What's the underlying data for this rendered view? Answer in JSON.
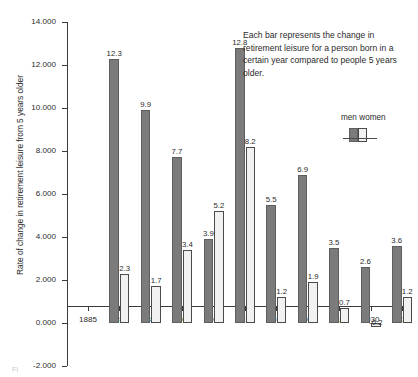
{
  "chart_data": {
    "type": "bar",
    "title": "",
    "xlabel": "",
    "ylabel": "Rate of change in retirement leisure from 5 years older",
    "categories": [
      "1885",
      "1890",
      "1895",
      "1900",
      "1905",
      "1910",
      "1915",
      "1920",
      "1925",
      "1930",
      "1935"
    ],
    "series": [
      {
        "name": "men",
        "color": "#7b7b7b",
        "values": [
          null,
          12.3,
          9.9,
          7.7,
          3.9,
          12.8,
          5.5,
          6.9,
          3.5,
          2.6,
          3.6
        ],
        "labels": [
          "",
          "12.3",
          "9.9",
          "7.7",
          "3.9",
          "12.8",
          "5.5",
          "6.9",
          "3.5",
          "2.6",
          "3.6"
        ]
      },
      {
        "name": "women",
        "color": "#f1f1f1",
        "values": [
          null,
          2.3,
          1.7,
          3.4,
          5.2,
          8.2,
          1.2,
          1.9,
          0.7,
          -0.2,
          1.2
        ],
        "labels": [
          "",
          "2.3",
          "1.7",
          "3.4",
          "5.2",
          "8.2",
          "1.2",
          "1.9",
          "0.7",
          "-0.2",
          "1.2"
        ]
      }
    ],
    "ylim": [
      -2.0,
      14.0
    ],
    "ytick_values": [
      14.0,
      12.0,
      10.0,
      8.0,
      6.0,
      4.0,
      2.0,
      0.0,
      -2.0
    ],
    "ytick_labels": [
      "14.000",
      "12.000",
      "10.000",
      "8.000",
      "6.000",
      "4.000",
      "2.000",
      "0.000",
      "-2.000"
    ],
    "grid": false,
    "legend_position": "upper-right-inside",
    "annotation": "Each bar represents the change in retirement leisure for a person born in a certain year compared to people 5 years older."
  },
  "legend": {
    "men_label": "men",
    "women_label": "women"
  },
  "caption_fragment": "Fi"
}
